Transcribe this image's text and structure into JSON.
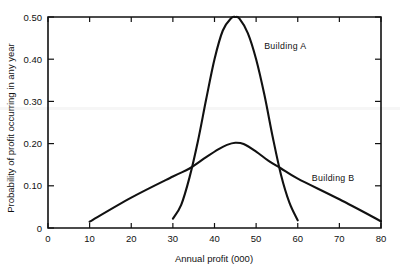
{
  "chart_data": {
    "type": "line",
    "title": "",
    "xlabel": "Annual profit (000)",
    "ylabel": "Probability of profit occurring in any year",
    "xlim": [
      0,
      80
    ],
    "ylim": [
      0,
      0.5
    ],
    "grid": false,
    "legend_position": "inline-annotation",
    "xticks": [
      "0",
      "10",
      "20",
      "30",
      "40",
      "50",
      "60",
      "70",
      "80"
    ],
    "xtick_values": [
      0,
      10,
      20,
      30,
      40,
      50,
      60,
      70,
      80
    ],
    "yticks": [
      "0",
      "0.10",
      "0.20",
      "0.30",
      "0.40",
      "0.50"
    ],
    "ytick_values": [
      0,
      0.1,
      0.2,
      0.3,
      0.4,
      0.5
    ],
    "series": [
      {
        "name": "Building A",
        "label": "Building A",
        "label_x": 57,
        "label_y": 0.425,
        "peak_x": 45,
        "peak_y": 0.5,
        "x": [
          30,
          32,
          34,
          36,
          38,
          40,
          42,
          44,
          45,
          46,
          48,
          50,
          52,
          54,
          56,
          58,
          60
        ],
        "values": [
          0.022,
          0.055,
          0.12,
          0.205,
          0.305,
          0.4,
          0.468,
          0.497,
          0.5,
          0.496,
          0.462,
          0.4,
          0.315,
          0.215,
          0.125,
          0.06,
          0.018
        ]
      },
      {
        "name": "Building B",
        "label": "Building B",
        "label_x": 68.5,
        "label_y": 0.112,
        "peak_x": 45,
        "peak_y": 0.202,
        "x": [
          10,
          20,
          30,
          34,
          38,
          41,
          43,
          45,
          47,
          50,
          53,
          56,
          60,
          70,
          80
        ],
        "values": [
          0.015,
          0.072,
          0.122,
          0.141,
          0.168,
          0.187,
          0.197,
          0.202,
          0.199,
          0.181,
          0.159,
          0.141,
          0.117,
          0.068,
          0.016
        ]
      }
    ],
    "annotations": [
      {
        "text": "Building A",
        "x": 57,
        "y": 0.425
      },
      {
        "text": "Building B",
        "x": 68.5,
        "y": 0.112
      }
    ],
    "colors": {
      "line": "#111111",
      "background": "#ffffff",
      "axis": "#111111"
    }
  }
}
